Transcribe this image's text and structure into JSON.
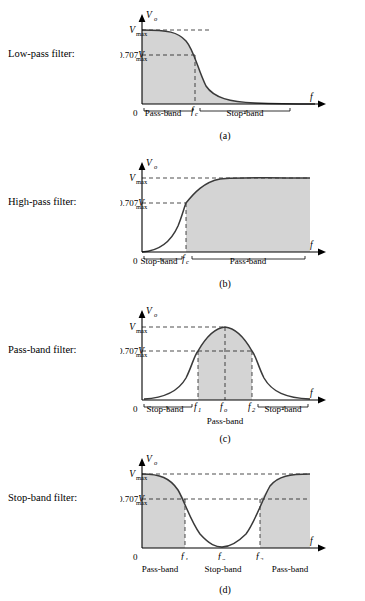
{
  "figure": {
    "title_hidden": "",
    "vmax_label": "V",
    "vmax_sub": "max",
    "v707_label": "0.707V",
    "v707_sub": "max",
    "vo_label": "V",
    "vo_sub": "o",
    "f_label": "f",
    "zero_label": "0"
  },
  "panels": [
    {
      "id": "low-pass",
      "row_label": "Low-pass filter:",
      "caption": "(a)",
      "type": "low-pass",
      "bands": [
        {
          "name": "Pass-band",
          "x_center": 0.3
        },
        {
          "name": "Stop-band",
          "x_center": 0.7
        }
      ],
      "marks": [
        {
          "label": "f",
          "sub": "c",
          "x": 0.46
        }
      ],
      "levels": [
        "V max",
        "0.707V max"
      ]
    },
    {
      "id": "high-pass",
      "row_label": "High-pass filter:",
      "caption": "(b)",
      "type": "high-pass",
      "bands": [
        {
          "name": "Stop-band",
          "x_center": 0.22
        },
        {
          "name": "Pass-band",
          "x_center": 0.68
        }
      ],
      "marks": [
        {
          "label": "f",
          "sub": "c",
          "x": 0.4
        }
      ],
      "levels": [
        "V max",
        "0.707V max"
      ]
    },
    {
      "id": "pass-band",
      "row_label": "Pass-band filter:",
      "caption": "(c)",
      "type": "pass-band",
      "bands": [
        {
          "name": "Stop-band",
          "x_center": 0.22
        },
        {
          "name": "Pass-band",
          "x_center": 0.52
        },
        {
          "name": "Stop-band",
          "x_center": 0.82
        }
      ],
      "marks": [
        {
          "label": "f",
          "sub": "1",
          "x": 0.39
        },
        {
          "label": "f",
          "sub": "o",
          "x": 0.54
        },
        {
          "label": "f",
          "sub": "2",
          "x": 0.69
        }
      ],
      "levels": [
        "V max",
        "0.707V max"
      ]
    },
    {
      "id": "stop-band",
      "row_label": "Stop-band filter:",
      "caption": "(d)",
      "type": "stop-band",
      "bands": [
        {
          "name": "Pass-band",
          "x_center": 0.22
        },
        {
          "name": "Stop-band",
          "x_center": 0.52
        },
        {
          "name": "Pass-band",
          "x_center": 0.82
        }
      ],
      "marks": [
        {
          "label": "f",
          "sub": "1",
          "x": 0.3
        },
        {
          "label": "f",
          "sub": "o",
          "x": 0.52
        },
        {
          "label": "f",
          "sub": "2",
          "x": 0.73
        }
      ],
      "levels": [
        "V max",
        "0.707V max"
      ]
    }
  ],
  "colors": {
    "fill": "#d4d4d4",
    "curve": "#3a3a3a",
    "axis": "#000000",
    "background": "#ffffff"
  }
}
